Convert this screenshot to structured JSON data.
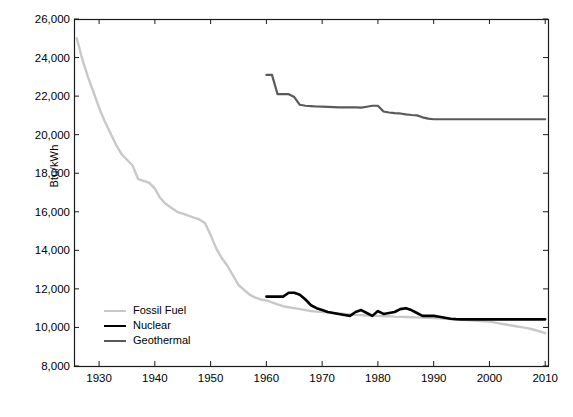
{
  "chart_data": {
    "type": "line",
    "title": "",
    "xlabel": "",
    "ylabel": "Btu/kWh",
    "xlim": [
      1925.5,
      2010.5
    ],
    "ylim": [
      8000,
      26000
    ],
    "grid": false,
    "legend_position": "center-left",
    "xticks": [
      1930,
      1940,
      1950,
      1960,
      1970,
      1980,
      1990,
      2000,
      2010
    ],
    "xtick_labels": [
      "1930",
      "1940",
      "1950",
      "1960",
      "1970",
      "1980",
      "1990",
      "2000",
      "2010"
    ],
    "yticks": [
      8000,
      10000,
      12000,
      14000,
      16000,
      18000,
      20000,
      22000,
      24000,
      26000
    ],
    "ytick_labels": [
      "8,000",
      "10,000",
      "12,000",
      "14,000",
      "16,000",
      "18,000",
      "20,000",
      "22,000",
      "24,000",
      "26,000"
    ],
    "series": [
      {
        "name": "Fossil Fuel",
        "color": "#c8c8c8",
        "width": 2.4,
        "x": [
          1926,
          1927,
          1928,
          1929,
          1930,
          1931,
          1932,
          1933,
          1934,
          1935,
          1936,
          1937,
          1938,
          1939,
          1940,
          1941,
          1942,
          1943,
          1944,
          1945,
          1946,
          1947,
          1948,
          1949,
          1950,
          1951,
          1952,
          1953,
          1954,
          1955,
          1956,
          1957,
          1958,
          1959,
          1960,
          1961,
          1962,
          1963,
          1964,
          1965,
          1966,
          1967,
          1968,
          1969,
          1970,
          1971,
          1972,
          1973,
          1974,
          1975,
          1976,
          1977,
          1978,
          1979,
          1980,
          1981,
          1982,
          1983,
          1984,
          1985,
          1986,
          1987,
          1988,
          1989,
          1990,
          1991,
          1992,
          1993,
          1994,
          1995,
          1996,
          1997,
          1998,
          1999,
          2000,
          2001,
          2002,
          2003,
          2004,
          2005,
          2006,
          2007,
          2008,
          2009,
          2010
        ],
        "y": [
          25000,
          23900,
          23000,
          22200,
          21400,
          20700,
          20100,
          19500,
          19000,
          18700,
          18400,
          17700,
          17600,
          17500,
          17200,
          16700,
          16400,
          16200,
          16000,
          15900,
          15800,
          15700,
          15600,
          15400,
          14800,
          14100,
          13600,
          13200,
          12700,
          12200,
          11950,
          11700,
          11550,
          11450,
          11400,
          11300,
          11200,
          11100,
          11050,
          11000,
          10950,
          10900,
          10850,
          10820,
          10800,
          10780,
          10750,
          10720,
          10700,
          10680,
          10650,
          10640,
          10620,
          10600,
          10600,
          10580,
          10580,
          10560,
          10550,
          10540,
          10530,
          10520,
          10510,
          10500,
          10490,
          10470,
          10450,
          10440,
          10420,
          10400,
          10380,
          10360,
          10340,
          10320,
          10300,
          10250,
          10200,
          10150,
          10100,
          10050,
          10000,
          9950,
          9880,
          9800,
          9700
        ]
      },
      {
        "name": "Nuclear",
        "color": "#000000",
        "width": 2.6,
        "x": [
          1960,
          1961,
          1962,
          1963,
          1964,
          1965,
          1966,
          1967,
          1968,
          1969,
          1970,
          1971,
          1972,
          1973,
          1974,
          1975,
          1976,
          1977,
          1978,
          1979,
          1980,
          1981,
          1982,
          1983,
          1984,
          1985,
          1986,
          1987,
          1988,
          1989,
          1990,
          1991,
          1992,
          1993,
          1994,
          1995,
          1996,
          1997,
          1998,
          1999,
          2000,
          2001,
          2002,
          2003,
          2004,
          2005,
          2006,
          2007,
          2008,
          2009,
          2010
        ],
        "y": [
          11600,
          11600,
          11600,
          11600,
          11800,
          11800,
          11700,
          11450,
          11150,
          11000,
          10900,
          10800,
          10750,
          10700,
          10650,
          10600,
          10800,
          10900,
          10750,
          10600,
          10850,
          10700,
          10750,
          10800,
          10950,
          11000,
          10900,
          10750,
          10600,
          10600,
          10600,
          10550,
          10500,
          10450,
          10430,
          10420,
          10420,
          10420,
          10420,
          10420,
          10420,
          10420,
          10420,
          10420,
          10420,
          10420,
          10420,
          10420,
          10420,
          10420,
          10420
        ]
      },
      {
        "name": "Geothermal",
        "color": "#5a5a5a",
        "width": 2.2,
        "x": [
          1960,
          1961,
          1962,
          1963,
          1964,
          1965,
          1966,
          1967,
          1968,
          1969,
          1970,
          1971,
          1972,
          1973,
          1974,
          1975,
          1976,
          1977,
          1978,
          1979,
          1980,
          1981,
          1982,
          1983,
          1984,
          1985,
          1986,
          1987,
          1988,
          1989,
          1990,
          1991,
          1992,
          1993,
          1994,
          1995,
          1996,
          1997,
          1998,
          1999,
          2000,
          2001,
          2002,
          2003,
          2004,
          2005,
          2006,
          2007,
          2008,
          2009,
          2010
        ],
        "y": [
          23100,
          23100,
          22100,
          22100,
          22100,
          21950,
          21550,
          21500,
          21480,
          21460,
          21450,
          21440,
          21430,
          21420,
          21420,
          21420,
          21420,
          21400,
          21450,
          21500,
          21500,
          21200,
          21150,
          21120,
          21100,
          21050,
          21020,
          21000,
          20900,
          20830,
          20800,
          20800,
          20800,
          20800,
          20800,
          20800,
          20800,
          20800,
          20800,
          20800,
          20800,
          20800,
          20800,
          20800,
          20800,
          20800,
          20800,
          20800,
          20800,
          20800,
          20800
        ]
      }
    ]
  }
}
